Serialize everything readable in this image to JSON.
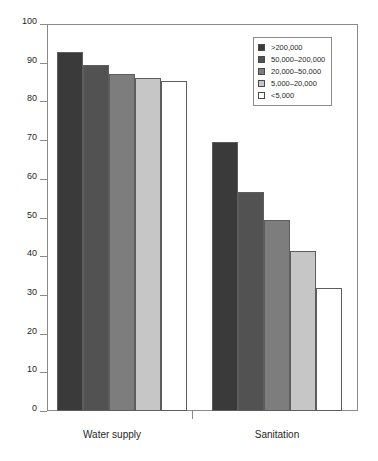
{
  "chart_data": {
    "type": "bar",
    "title": "",
    "subtitle": "",
    "xlabel": "",
    "ylabel": "",
    "ylim": [
      0,
      100
    ],
    "yticks": [
      0,
      10,
      20,
      30,
      40,
      50,
      60,
      70,
      80,
      90,
      100
    ],
    "ytick_labels": [
      "0",
      "10",
      "20",
      "30",
      "40",
      "50",
      "60",
      "70",
      "80",
      "90",
      "100"
    ],
    "grid": false,
    "legend_position": "top-right",
    "categories": [
      "Water supply",
      "Sanitation"
    ],
    "series": [
      {
        "name": ">200,000",
        "color": "#3a3a3a",
        "values": [
          92.8,
          69.4
        ]
      },
      {
        "name": "50,000–200,000",
        "color": "#525252",
        "values": [
          89.4,
          56.6
        ]
      },
      {
        "name": "20,000–50,000",
        "color": "#7d7d7d",
        "values": [
          87.1,
          49.4
        ]
      },
      {
        "name": "5,000–20,000",
        "color": "#c6c6c6",
        "values": [
          86.0,
          41.3
        ]
      },
      {
        "name": "<5,000",
        "color": "#ffffff",
        "values": [
          85.3,
          31.8
        ]
      }
    ]
  },
  "legend": {
    "entries": [
      {
        "label": ">200,000",
        "swatch": "#3a3a3a"
      },
      {
        "label": "50,000–200,000",
        "swatch": "#525252"
      },
      {
        "label": "20,000–50,000",
        "swatch": "#7d7d7d"
      },
      {
        "label": "5,000–20,000",
        "swatch": "#c6c6c6"
      },
      {
        "label": "<5,000",
        "swatch": "#ffffff"
      }
    ]
  },
  "axes": {
    "y_tick_labels": [
      "100",
      "90",
      "80",
      "70",
      "60",
      "50",
      "40",
      "30",
      "20",
      "10",
      "0"
    ],
    "x_group_labels": [
      "Water supply",
      "Sanitation"
    ]
  }
}
